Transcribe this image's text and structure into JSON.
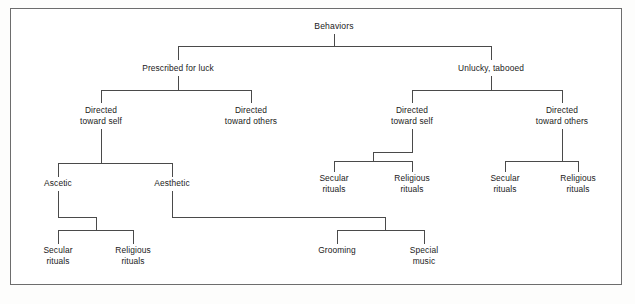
{
  "figure": {
    "background_color": "#ffffff",
    "frame_color": "#6d6d6d",
    "line_color": "#4a4a4a",
    "text_color": "#1a1a1a"
  },
  "nodes": {
    "root": {
      "label": "Behaviors",
      "x": 334,
      "y": 29
    },
    "prescribed": {
      "label": "Prescribed for luck",
      "x": 178,
      "y": 71
    },
    "unlucky": {
      "label": "Unlucky, tabooed",
      "x": 491,
      "y": 71
    },
    "p_self_l1": {
      "label": "Directed",
      "x": 101,
      "y": 113
    },
    "p_self_l2": {
      "label": "toward self",
      "x": 101,
      "y": 124
    },
    "p_others_l1": {
      "label": "Directed",
      "x": 251,
      "y": 113
    },
    "p_others_l2": {
      "label": "toward others",
      "x": 251,
      "y": 124
    },
    "u_self_l1": {
      "label": "Directed",
      "x": 412,
      "y": 113
    },
    "u_self_l2": {
      "label": "toward self",
      "x": 412,
      "y": 124
    },
    "u_others_l1": {
      "label": "Directed",
      "x": 562,
      "y": 113
    },
    "u_others_l2": {
      "label": "toward others",
      "x": 562,
      "y": 124
    },
    "ascetic": {
      "label": "Ascetic",
      "x": 58,
      "y": 186
    },
    "aesthetic": {
      "label": "Aesthetic",
      "x": 172,
      "y": 186
    },
    "u_self_secular_l1": {
      "label": "Secular",
      "x": 334,
      "y": 181
    },
    "u_self_secular_l2": {
      "label": "rituals",
      "x": 334,
      "y": 192
    },
    "u_self_religious_l1": {
      "label": "Religious",
      "x": 412,
      "y": 181
    },
    "u_self_religious_l2": {
      "label": "rituals",
      "x": 412,
      "y": 192
    },
    "u_other_secular_l1": {
      "label": "Secular",
      "x": 505,
      "y": 181
    },
    "u_other_secular_l2": {
      "label": "rituals",
      "x": 505,
      "y": 192
    },
    "u_other_religious_l1": {
      "label": "Religious",
      "x": 578,
      "y": 181
    },
    "u_other_religious_l2": {
      "label": "rituals",
      "x": 578,
      "y": 192
    },
    "asc_secular_l1": {
      "label": "Secular",
      "x": 58,
      "y": 253
    },
    "asc_secular_l2": {
      "label": "rituals",
      "x": 58,
      "y": 264
    },
    "asc_religious_l1": {
      "label": "Religious",
      "x": 133,
      "y": 253
    },
    "asc_religious_l2": {
      "label": "rituals",
      "x": 133,
      "y": 264
    },
    "grooming": {
      "label": "Grooming",
      "x": 337,
      "y": 253
    },
    "special_l1": {
      "label": "Special",
      "x": 424,
      "y": 253
    },
    "special_l2": {
      "label": "music",
      "x": 424,
      "y": 264
    }
  },
  "connectors": [
    {
      "id": "root-stem",
      "d": "M 334 34 L 334 46"
    },
    {
      "id": "root-bar",
      "d": "M 178 46 L 491 46"
    },
    {
      "id": "root-drop-left",
      "d": "M 178 46 L 178 60"
    },
    {
      "id": "root-drop-right",
      "d": "M 491 46 L 491 60"
    },
    {
      "id": "pres-stem",
      "d": "M 178 76 L 178 90"
    },
    {
      "id": "pres-bar",
      "d": "M 101 90 L 251 90"
    },
    {
      "id": "pres-drop-left",
      "d": "M 101 90 L 101 103"
    },
    {
      "id": "pres-drop-right",
      "d": "M 251 90 L 251 103"
    },
    {
      "id": "unl-stem",
      "d": "M 491 76 L 491 90"
    },
    {
      "id": "unl-bar",
      "d": "M 412 90 L 562 90"
    },
    {
      "id": "unl-drop-left",
      "d": "M 412 90 L 412 103"
    },
    {
      "id": "unl-drop-right",
      "d": "M 562 90 L 562 103"
    },
    {
      "id": "pself-stem",
      "d": "M 101 129 L 101 163"
    },
    {
      "id": "pself-bar",
      "d": "M 58 163 L 172 163"
    },
    {
      "id": "pself-drop-left",
      "d": "M 58 163 L 58 177"
    },
    {
      "id": "pself-drop-right",
      "d": "M 172 163 L 172 177"
    },
    {
      "id": "uself-step",
      "d": "M 412 129 L 412 152 L 373 152 L 373 161"
    },
    {
      "id": "uself-bar",
      "d": "M 334 161 L 412 161"
    },
    {
      "id": "uself-drop-left",
      "d": "M 334 161 L 334 172"
    },
    {
      "id": "uself-drop-right",
      "d": "M 412 161 L 412 172"
    },
    {
      "id": "uothers-stem",
      "d": "M 562 129 L 562 161"
    },
    {
      "id": "uothers-bar",
      "d": "M 505 161 L 578 161"
    },
    {
      "id": "uothers-drop-left",
      "d": "M 505 161 L 505 172"
    },
    {
      "id": "uothers-drop-right",
      "d": "M 578 161 L 578 172"
    },
    {
      "id": "ascetic-step",
      "d": "M 58 191 L 58 217 L 96 217 L 96 230"
    },
    {
      "id": "ascetic-bar",
      "d": "M 58 230 L 133 230"
    },
    {
      "id": "ascetic-drop-left",
      "d": "M 58 230 L 58 244"
    },
    {
      "id": "ascetic-drop-right",
      "d": "M 133 230 L 133 244"
    },
    {
      "id": "aesthetic-step",
      "d": "M 172 191 L 172 217 L 385 217 L 385 230"
    },
    {
      "id": "aesthetic-bar",
      "d": "M 337 230 L 424 230"
    },
    {
      "id": "aesthetic-drop-l",
      "d": "M 337 230 L 337 244"
    },
    {
      "id": "aesthetic-drop-r",
      "d": "M 424 230 L 424 244"
    }
  ],
  "frame": {
    "x": 10,
    "y": 8,
    "width": 612,
    "height": 277
  },
  "chart_data": {
    "type": "table",
    "levels": [
      "Behaviors",
      "Luck orientation",
      "Direction",
      "Mode",
      "Ritual type"
    ],
    "tree": {
      "name": "Behaviors",
      "children": [
        {
          "name": "Prescribed for luck",
          "children": [
            {
              "name": "Directed toward self",
              "children": [
                {
                  "name": "Ascetic",
                  "children": [
                    {
                      "name": "Secular rituals",
                      "children": []
                    },
                    {
                      "name": "Religious rituals",
                      "children": []
                    }
                  ]
                },
                {
                  "name": "Aesthetic",
                  "children": [
                    {
                      "name": "Grooming",
                      "children": []
                    },
                    {
                      "name": "Special music",
                      "children": []
                    }
                  ]
                }
              ]
            },
            {
              "name": "Directed toward others",
              "children": []
            }
          ]
        },
        {
          "name": "Unlucky, tabooed",
          "children": [
            {
              "name": "Directed toward self",
              "children": [
                {
                  "name": "Secular rituals",
                  "children": []
                },
                {
                  "name": "Religious rituals",
                  "children": []
                }
              ]
            },
            {
              "name": "Directed toward others",
              "children": [
                {
                  "name": "Secular rituals",
                  "children": []
                },
                {
                  "name": "Religious rituals",
                  "children": []
                }
              ]
            }
          ]
        }
      ]
    }
  }
}
